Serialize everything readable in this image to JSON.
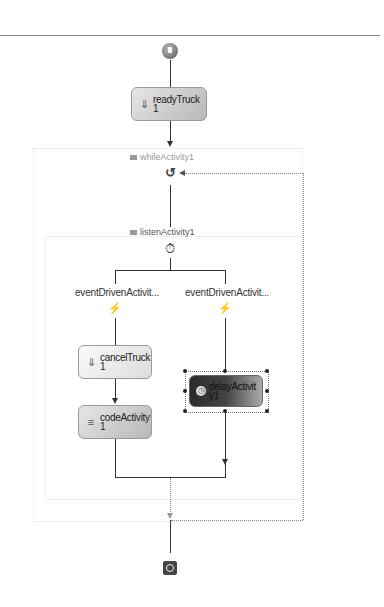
{
  "diagram": {
    "type": "sequential-workflow",
    "start_node": {
      "icon": "start-icon"
    },
    "end_node": {
      "icon": "stop-icon"
    },
    "activities": [
      {
        "id": "readyTruck",
        "label": "readyTruck\n1",
        "style": "gray",
        "icon": "event-sink-icon"
      },
      {
        "id": "cancelTruck",
        "label": "cancelTruck\n1",
        "style": "light",
        "icon": "event-sink-icon"
      },
      {
        "id": "codeActivity",
        "label": "codeActivity\n1",
        "style": "gray",
        "icon": "code-icon"
      },
      {
        "id": "delayActivity",
        "label": "delayActivit\ny1",
        "style": "dark-selected",
        "icon": "clock-icon"
      }
    ],
    "composites": {
      "while": {
        "label": "whileActivity1",
        "icon": "loop-icon"
      },
      "listen": {
        "label": "listenActivity1",
        "icon": "listen-icon"
      }
    },
    "branches": [
      {
        "label": "eventDrivenActivit...",
        "icon": "event-driven-icon"
      },
      {
        "label": "eventDrivenActivit...",
        "icon": "event-driven-icon"
      }
    ],
    "glyphs": {
      "loop": "↺",
      "listen": "⏱",
      "event_driven": "⚡",
      "event_sink": "⇓",
      "code": "≡",
      "clock": "◷"
    }
  }
}
